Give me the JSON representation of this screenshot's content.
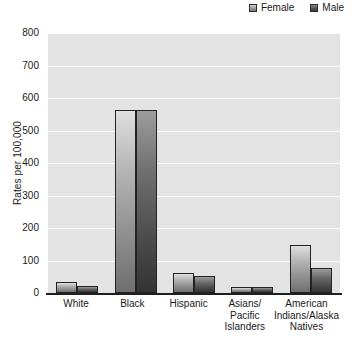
{
  "legend": {
    "position": "top-right",
    "entries": [
      {
        "label": "Female",
        "swatch": "female-swatch",
        "color": "#a9a9a9"
      },
      {
        "label": "Male",
        "swatch": "male-swatch",
        "color": "#4c4c4c"
      }
    ]
  },
  "axes": {
    "y_title": "Rates per 100,000",
    "y_ticks": [
      "800",
      "700",
      "600",
      "500",
      "400",
      "300",
      "200",
      "100",
      "0"
    ]
  },
  "chart_data": {
    "type": "bar",
    "title": "",
    "xlabel": "",
    "ylabel": "Rates per 100,000",
    "ylim": [
      0,
      800
    ],
    "ytick_step": 100,
    "grid": true,
    "legend_position": "top-right",
    "categories": [
      "White",
      "Black",
      "Hispanic",
      "Asians/ Pacific Islanders",
      "American Indians/Alaska Natives"
    ],
    "category_lines": [
      [
        "White"
      ],
      [
        "Black"
      ],
      [
        "Hispanic"
      ],
      [
        "Asians/",
        "Pacific",
        "Islanders"
      ],
      [
        "American",
        "Indians/Alaska",
        "Natives"
      ]
    ],
    "series": [
      {
        "name": "Female",
        "values": [
          35,
          562,
          62,
          20,
          148
        ]
      },
      {
        "name": "Male",
        "values": [
          22,
          562,
          52,
          17,
          78
        ]
      }
    ]
  }
}
